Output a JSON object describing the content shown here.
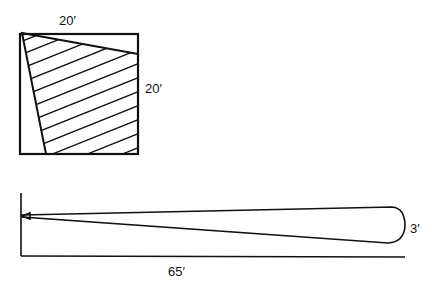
{
  "top_figure": {
    "description": "Square room with shaded triangular light coverage area",
    "width_label": "20′",
    "height_label": "20′"
  },
  "bottom_figure": {
    "description": "Side elevation of a narrow beam spreading from wall",
    "length_label": "65′",
    "spread_label": "3′"
  },
  "colors": {
    "line": "#111111",
    "background": "#ffffff"
  }
}
